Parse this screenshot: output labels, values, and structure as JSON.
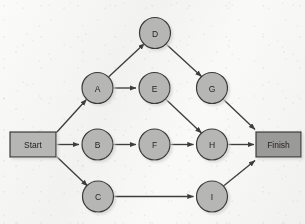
{
  "diagram": {
    "type": "activity-on-node network",
    "background_color": "#f3f3f1",
    "node_fill": "#b6b6b4",
    "node_stroke": "#3a3a38",
    "terminal_start_fill": "#b6b6b4",
    "terminal_finish_fill": "#9a9a98",
    "edge_color": "#3d3d3b",
    "shadow_color": "#c9c9c6",
    "terminals": [
      {
        "id": "start",
        "label": "Start",
        "x": 33,
        "y": 144.5,
        "w": 46,
        "h": 25
      },
      {
        "id": "finish",
        "label": "Finish",
        "x": 278,
        "y": 144.5,
        "w": 45,
        "h": 25
      }
    ],
    "nodes": [
      {
        "id": "D",
        "label": "D",
        "cx": 155,
        "cy": 33,
        "r": 15.5
      },
      {
        "id": "A",
        "label": "A",
        "cx": 97.5,
        "cy": 88,
        "r": 15.5
      },
      {
        "id": "E",
        "label": "E",
        "cx": 154.5,
        "cy": 88,
        "r": 15.5
      },
      {
        "id": "G",
        "label": "G",
        "cx": 212,
        "cy": 88,
        "r": 15.5
      },
      {
        "id": "B",
        "label": "B",
        "cx": 97.5,
        "cy": 144.5,
        "r": 15.5
      },
      {
        "id": "F",
        "label": "F",
        "cx": 154.5,
        "cy": 144.5,
        "r": 15.5
      },
      {
        "id": "H",
        "label": "H",
        "cx": 212,
        "cy": 144.5,
        "r": 15.5
      },
      {
        "id": "C",
        "label": "C",
        "cx": 98,
        "cy": 196.5,
        "r": 15.5
      },
      {
        "id": "I",
        "label": "I",
        "cx": 212,
        "cy": 196.5,
        "r": 15.5
      }
    ],
    "edges": [
      {
        "from": "Start",
        "to": "A"
      },
      {
        "from": "Start",
        "to": "B"
      },
      {
        "from": "Start",
        "to": "C"
      },
      {
        "from": "A",
        "to": "D"
      },
      {
        "from": "A",
        "to": "E"
      },
      {
        "from": "D",
        "to": "G"
      },
      {
        "from": "E",
        "to": "H"
      },
      {
        "from": "B",
        "to": "F"
      },
      {
        "from": "F",
        "to": "H"
      },
      {
        "from": "C",
        "to": "I"
      },
      {
        "from": "G",
        "to": "Finish"
      },
      {
        "from": "H",
        "to": "Finish"
      },
      {
        "from": "I",
        "to": "Finish"
      }
    ]
  }
}
